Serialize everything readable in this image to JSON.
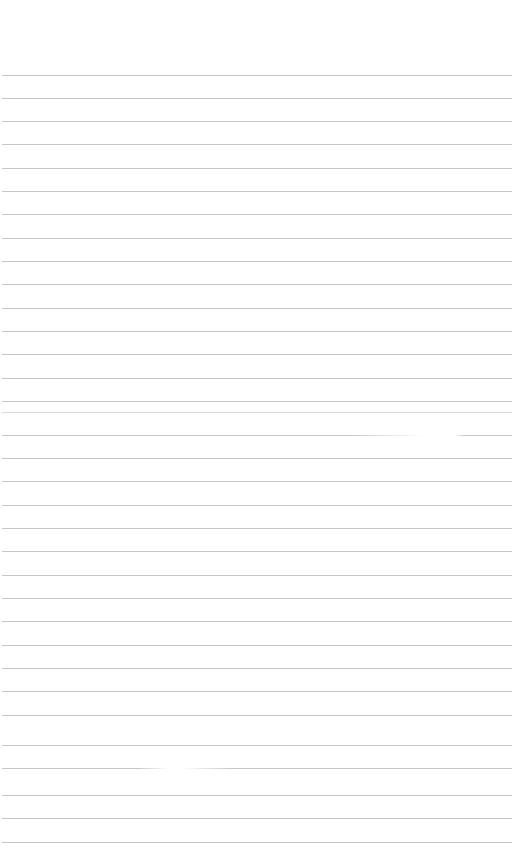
{
  "document": {
    "kind": "scanned-ruled-paper",
    "orientation": "portrait",
    "page_width_px": 524,
    "page_height_px": 864,
    "background_color": "#ffffff",
    "rule_color": "#b9bcc0",
    "rule_color_faded": "#cdd0d3",
    "text_content": "",
    "has_text": false,
    "has_handwriting": false,
    "notes_label": "",
    "ruling": {
      "line_count": 34,
      "first_line_y": 75,
      "line_spacing_px": 23.3,
      "line_thickness_px": 1,
      "line_start_x": 2,
      "line_end_x": 512,
      "top_margin_px": 75,
      "left_margin_px": 2,
      "right_margin_px": 12,
      "bottom_margin_px": 22
    },
    "lines": [
      {
        "index": 1,
        "y": 75,
        "x1": 2,
        "x2": 512,
        "faded": false,
        "broken": false
      },
      {
        "index": 2,
        "y": 98,
        "x1": 2,
        "x2": 512,
        "faded": false,
        "broken": false
      },
      {
        "index": 3,
        "y": 121,
        "x1": 2,
        "x2": 512,
        "faded": false,
        "broken": false
      },
      {
        "index": 4,
        "y": 144,
        "x1": 2,
        "x2": 512,
        "faded": false,
        "broken": false
      },
      {
        "index": 5,
        "y": 168,
        "x1": 2,
        "x2": 512,
        "faded": false,
        "broken": false
      },
      {
        "index": 6,
        "y": 191,
        "x1": 2,
        "x2": 512,
        "faded": false,
        "broken": false
      },
      {
        "index": 7,
        "y": 214,
        "x1": 2,
        "x2": 512,
        "faded": false,
        "broken": false
      },
      {
        "index": 8,
        "y": 238,
        "x1": 2,
        "x2": 512,
        "faded": false,
        "broken": false
      },
      {
        "index": 9,
        "y": 261,
        "x1": 2,
        "x2": 512,
        "faded": false,
        "broken": false
      },
      {
        "index": 10,
        "y": 284,
        "x1": 2,
        "x2": 512,
        "faded": false,
        "broken": false
      },
      {
        "index": 11,
        "y": 308,
        "x1": 2,
        "x2": 512,
        "faded": false,
        "broken": false
      },
      {
        "index": 12,
        "y": 331,
        "x1": 2,
        "x2": 512,
        "faded": false,
        "broken": false
      },
      {
        "index": 13,
        "y": 354,
        "x1": 2,
        "x2": 512,
        "faded": false,
        "broken": false
      },
      {
        "index": 14,
        "y": 378,
        "x1": 2,
        "x2": 512,
        "faded": false,
        "broken": false
      },
      {
        "index": 15,
        "y": 401,
        "x1": 2,
        "x2": 512,
        "faded": false,
        "broken": false
      },
      {
        "index": 16,
        "y": 412,
        "x1": 2,
        "x2": 512,
        "faded": true,
        "broken": false
      },
      {
        "index": 17,
        "y": 435,
        "x1": 2,
        "x2": 512,
        "faded": false,
        "broken": true,
        "segments": [
          {
            "x1": 2,
            "x2": 425
          },
          {
            "x1": 455,
            "x2": 512
          }
        ]
      },
      {
        "index": 18,
        "y": 458,
        "x1": 2,
        "x2": 512,
        "faded": false,
        "broken": false
      },
      {
        "index": 19,
        "y": 481,
        "x1": 2,
        "x2": 512,
        "faded": false,
        "broken": false
      },
      {
        "index": 20,
        "y": 505,
        "x1": 2,
        "x2": 512,
        "faded": false,
        "broken": false
      },
      {
        "index": 21,
        "y": 528,
        "x1": 2,
        "x2": 512,
        "faded": false,
        "broken": false
      },
      {
        "index": 22,
        "y": 551,
        "x1": 2,
        "x2": 512,
        "faded": false,
        "broken": false
      },
      {
        "index": 23,
        "y": 575,
        "x1": 2,
        "x2": 512,
        "faded": false,
        "broken": false
      },
      {
        "index": 24,
        "y": 598,
        "x1": 2,
        "x2": 512,
        "faded": false,
        "broken": false
      },
      {
        "index": 25,
        "y": 621,
        "x1": 2,
        "x2": 512,
        "faded": false,
        "broken": false
      },
      {
        "index": 26,
        "y": 645,
        "x1": 2,
        "x2": 512,
        "faded": false,
        "broken": false
      },
      {
        "index": 27,
        "y": 668,
        "x1": 2,
        "x2": 512,
        "faded": false,
        "broken": false
      },
      {
        "index": 28,
        "y": 691,
        "x1": 2,
        "x2": 512,
        "faded": false,
        "broken": false
      },
      {
        "index": 29,
        "y": 715,
        "x1": 2,
        "x2": 512,
        "faded": false,
        "broken": false
      },
      {
        "index": 30,
        "y": 745,
        "x1": 2,
        "x2": 512,
        "faded": false,
        "broken": false
      },
      {
        "index": 31,
        "y": 768,
        "x1": 2,
        "x2": 512,
        "faded": false,
        "broken": true,
        "segments": [
          {
            "x1": 2,
            "x2": 168
          },
          {
            "x1": 182,
            "x2": 512
          }
        ]
      },
      {
        "index": 32,
        "y": 795,
        "x1": 2,
        "x2": 512,
        "faded": false,
        "broken": false
      },
      {
        "index": 33,
        "y": 818,
        "x1": 2,
        "x2": 512,
        "faded": false,
        "broken": false
      },
      {
        "index": 34,
        "y": 842,
        "x1": 2,
        "x2": 512,
        "faded": false,
        "broken": false
      }
    ]
  }
}
